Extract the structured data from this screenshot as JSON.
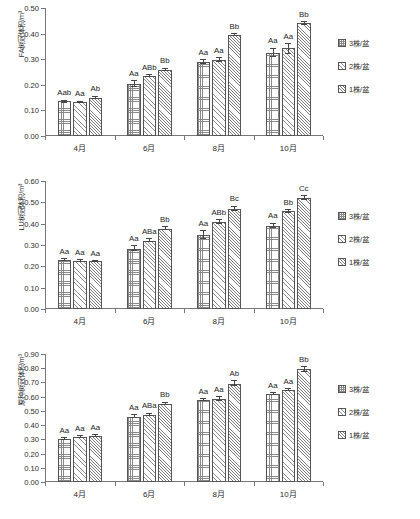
{
  "legend": {
    "position": "right",
    "items": [
      {
        "label": "3株/盆",
        "pattern": "grid"
      },
      {
        "label": "2株/盆",
        "pattern": "hatch"
      },
      {
        "label": "1株/盆",
        "pattern": "hatch2"
      }
    ]
  },
  "chart_data": [
    {
      "type": "bar",
      "title": "",
      "xlabel": "",
      "ylabel": "FA树冠体积/m³",
      "ylim": [
        0.0,
        0.5
      ],
      "yticks": [
        "0.00",
        "0.10",
        "0.20",
        "0.30",
        "0.40",
        "0.50"
      ],
      "ytick_values": [
        0.0,
        0.1,
        0.2,
        0.3,
        0.4,
        0.5
      ],
      "grid": false,
      "categories": [
        "4月",
        "6月",
        "8月",
        "10月"
      ],
      "series": [
        {
          "name": "3株/盆",
          "values": [
            0.135,
            0.203,
            0.289,
            0.326
          ],
          "errors": [
            0.004,
            0.011,
            0.008,
            0.016
          ],
          "annotations": [
            "Aab",
            "Aa",
            "Aa",
            "Aa"
          ]
        },
        {
          "name": "2株/盆",
          "values": [
            0.132,
            0.236,
            0.296,
            0.342
          ],
          "errors": [
            0.003,
            0.004,
            0.008,
            0.019
          ],
          "annotations": [
            "Aa",
            "ABb",
            "Aa",
            "Aa"
          ]
        },
        {
          "name": "1株/盆",
          "values": [
            0.15,
            0.259,
            0.394,
            0.44
          ],
          "errors": [
            0.005,
            0.005,
            0.004,
            0.006
          ],
          "annotations": [
            "Ab",
            "Bb",
            "Bb",
            "Bb"
          ]
        }
      ]
    },
    {
      "type": "bar",
      "title": "",
      "xlabel": "",
      "ylabel": "LU树冠体积/m³",
      "ylim": [
        0.0,
        0.6
      ],
      "yticks": [
        "0.00",
        "0.10",
        "0.20",
        "0.30",
        "0.40",
        "0.50",
        "0.60"
      ],
      "ytick_values": [
        0.0,
        0.1,
        0.2,
        0.3,
        0.4,
        0.5,
        0.6
      ],
      "grid": false,
      "categories": [
        "4月",
        "6月",
        "8月",
        "10月"
      ],
      "series": [
        {
          "name": "3株/盆",
          "values": [
            0.231,
            0.283,
            0.348,
            0.39
          ],
          "errors": [
            0.005,
            0.011,
            0.017,
            0.011
          ],
          "annotations": [
            "Aa",
            "Aa",
            "Aa",
            "Aa"
          ]
        },
        {
          "name": "2株/盆",
          "values": [
            0.226,
            0.321,
            0.408,
            0.458
          ],
          "errors": [
            0.003,
            0.006,
            0.009,
            0.005
          ],
          "annotations": [
            "Aa",
            "ABa",
            "ABb",
            "Bb"
          ]
        },
        {
          "name": "1株/盆",
          "values": [
            0.223,
            0.377,
            0.471,
            0.521
          ],
          "errors": [
            0.003,
            0.007,
            0.01,
            0.008
          ],
          "annotations": [
            "Aa",
            "Bb",
            "Bc",
            "Cc"
          ]
        }
      ]
    },
    {
      "type": "bar",
      "title": "",
      "xlabel": "",
      "ylabel": "原种树冠体积/m³",
      "ylim": [
        0.0,
        0.9
      ],
      "yticks": [
        "0.00",
        "0.10",
        "0.20",
        "0.30",
        "0.40",
        "0.50",
        "0.60",
        "0.70",
        "0.80",
        "0.90"
      ],
      "ytick_values": [
        0.0,
        0.1,
        0.2,
        0.3,
        0.4,
        0.5,
        0.6,
        0.7,
        0.8,
        0.9
      ],
      "grid": false,
      "categories": [
        "4月",
        "6月",
        "8月",
        "10月"
      ],
      "series": [
        {
          "name": "3株/盆",
          "values": [
            0.303,
            0.46,
            0.577,
            0.62
          ],
          "errors": [
            0.006,
            0.011,
            0.005,
            0.009
          ],
          "annotations": [
            "Aa",
            "Aa",
            "Aa",
            "Aa"
          ]
        },
        {
          "name": "2株/盆",
          "values": [
            0.318,
            0.474,
            0.587,
            0.648
          ],
          "errors": [
            0.004,
            0.009,
            0.014,
            0.007
          ],
          "annotations": [
            "Aa",
            "ABa",
            "Aa",
            "Aa"
          ]
        },
        {
          "name": "1株/盆",
          "values": [
            0.322,
            0.552,
            0.692,
            0.793
          ],
          "errors": [
            0.007,
            0.008,
            0.018,
            0.016
          ],
          "annotations": [
            "Aa",
            "Bb",
            "Ab",
            "Bb"
          ]
        }
      ]
    }
  ]
}
